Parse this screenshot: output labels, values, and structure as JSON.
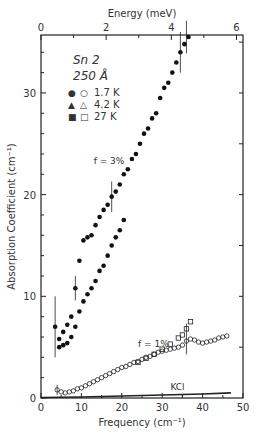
{
  "chart_data": {
    "type": "scatter",
    "title": "",
    "sample_label": "Sn 2",
    "thickness_label": "250 Å",
    "xlabel": "Frequency (cm⁻¹)",
    "ylabel": "Absorption Coefficient (cm⁻¹)",
    "top_xlabel": "Energy (meV)",
    "xlim": [
      0,
      50
    ],
    "ylim": [
      0,
      35.7
    ],
    "top_xlim": [
      0,
      6.2
    ],
    "x_ticks": [
      0,
      10,
      20,
      30,
      40,
      50
    ],
    "y_ticks": [
      0,
      10,
      20,
      30
    ],
    "top_x_ticks": [
      0,
      2,
      4,
      6
    ],
    "legend": [
      {
        "filled": "●",
        "open": "○",
        "label": "1.7 K"
      },
      {
        "filled": "▲",
        "open": "△",
        "label": "4.2 K"
      },
      {
        "filled": "■",
        "open": "□",
        "label": "27 K"
      }
    ],
    "annotations": [
      {
        "text": "f = 3%",
        "x": 16,
        "y": 23
      },
      {
        "text": "f = 1%",
        "x": 27,
        "y": 5
      },
      {
        "text": "KCl",
        "x": 35,
        "y": 0.8
      }
    ],
    "series": [
      {
        "name": "f = 3%",
        "marker": "filled",
        "x": [
          3.5,
          4.5,
          5.5,
          6.5,
          7.5,
          8.5,
          9.5,
          10.5,
          11.5,
          12.5,
          13.5,
          14.5,
          15.5,
          16.5,
          17.5,
          18.5,
          19.5,
          20.5,
          21.5,
          22.5,
          23.5,
          24.5,
          25.5,
          26.5,
          27.5,
          28.5,
          29.5,
          30.5,
          31.5,
          32.5,
          33.5,
          34.5,
          35.5,
          36.5
        ],
        "y": [
          7.0,
          5.8,
          6.5,
          7.2,
          8.0,
          10.8,
          13.5,
          15.5,
          15.8,
          16.0,
          17.0,
          17.8,
          18.5,
          19.0,
          19.8,
          20.3,
          21.0,
          22.0,
          22.5,
          23.5,
          24.0,
          25.0,
          26.0,
          26.5,
          27.5,
          28.0,
          29.5,
          30.5,
          31.0,
          32.0,
          33.0,
          34.0,
          34.8,
          35.5
        ]
      },
      {
        "name": "f = 3% (lower branch)",
        "marker": "filled",
        "x": [
          4.5,
          5.5,
          6.5,
          7.5,
          8.5,
          9.5,
          10.5,
          11.5,
          12.5,
          13.5,
          14.5,
          15.5,
          16.5,
          17.5,
          18.5,
          19.5,
          20.5
        ],
        "y": [
          5.0,
          5.2,
          5.4,
          6.0,
          7.0,
          8.5,
          9.5,
          10.2,
          10.8,
          11.5,
          12.5,
          13.0,
          14.0,
          15.0,
          15.8,
          16.5,
          17.5
        ]
      },
      {
        "name": "f = 1%",
        "marker": "open",
        "x": [
          4,
          5,
          6,
          7,
          8,
          9,
          10,
          11,
          12,
          13,
          14,
          15,
          16,
          17,
          18,
          19,
          20,
          21,
          22,
          23,
          24,
          25,
          26,
          27,
          28,
          29,
          30,
          31,
          32,
          33,
          34,
          35,
          36,
          37,
          38,
          39,
          40,
          41,
          42,
          43,
          44,
          45,
          46
        ],
        "y": [
          0.8,
          0.6,
          0.5,
          0.6,
          0.7,
          0.9,
          1.0,
          1.2,
          1.4,
          1.6,
          1.8,
          2.0,
          2.2,
          2.4,
          2.6,
          2.8,
          3.0,
          3.1,
          3.3,
          3.5,
          3.6,
          3.8,
          4.0,
          4.1,
          4.3,
          4.5,
          4.6,
          4.7,
          4.8,
          4.9,
          5.0,
          5.2,
          5.6,
          5.8,
          5.7,
          5.5,
          5.4,
          5.5,
          5.6,
          5.7,
          5.9,
          6.0,
          6.1
        ]
      },
      {
        "name": "f = 1% (27 K)",
        "marker": "open-square",
        "x": [
          24,
          26,
          28,
          30,
          32,
          34,
          35,
          36,
          37
        ],
        "y": [
          3.5,
          3.9,
          4.3,
          4.8,
          5.3,
          5.9,
          6.2,
          6.8,
          7.5
        ]
      },
      {
        "name": "KCl",
        "marker": "line",
        "x": [
          0,
          10,
          20,
          30,
          40,
          47
        ],
        "y": [
          0.05,
          0.1,
          0.2,
          0.3,
          0.4,
          0.5
        ]
      }
    ]
  }
}
